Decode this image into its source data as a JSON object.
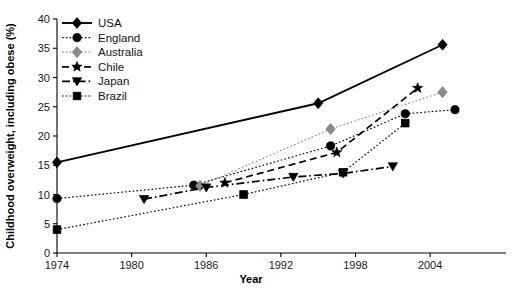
{
  "chart_data": {
    "type": "line",
    "title": "",
    "xlabel": "Year",
    "ylabel": "Childhood overweight, including obese (%)",
    "xlim": [
      1974,
      2006
    ],
    "ylim": [
      0,
      40
    ],
    "xticks": [
      1974,
      1980,
      1986,
      1992,
      1998,
      2004
    ],
    "yticks": [
      0,
      5,
      10,
      15,
      20,
      25,
      30,
      35,
      40
    ],
    "grid": false,
    "legend_position": "top-left",
    "series": [
      {
        "name": "USA",
        "color": "#000000",
        "marker": "diamond",
        "linestyle": "solid",
        "points": [
          {
            "x": 1974,
            "y": 15.5
          },
          {
            "x": 1995,
            "y": 25.6
          },
          {
            "x": 2005,
            "y": 35.6
          }
        ]
      },
      {
        "name": "England",
        "color": "#000000",
        "marker": "circle",
        "linestyle": "dotted",
        "points": [
          {
            "x": 1974,
            "y": 9.3
          },
          {
            "x": 1985,
            "y": 11.6
          },
          {
            "x": 1996,
            "y": 18.3
          },
          {
            "x": 2002,
            "y": 23.8
          },
          {
            "x": 2006,
            "y": 24.5
          }
        ]
      },
      {
        "name": "Australia",
        "color": "#8c8c8c",
        "marker": "diamond",
        "linestyle": "dotted",
        "points": [
          {
            "x": 1985.5,
            "y": 11.5
          },
          {
            "x": 1996,
            "y": 21.2
          },
          {
            "x": 2005,
            "y": 27.5
          }
        ]
      },
      {
        "name": "Chile",
        "color": "#000000",
        "marker": "star",
        "linestyle": "dashed",
        "points": [
          {
            "x": 1987.5,
            "y": 12.0
          },
          {
            "x": 1996.5,
            "y": 17.2
          },
          {
            "x": 2003,
            "y": 28.2
          }
        ]
      },
      {
        "name": "Japan",
        "color": "#000000",
        "marker": "triangle-down",
        "linestyle": "dash-dot",
        "points": [
          {
            "x": 1981,
            "y": 9.2
          },
          {
            "x": 1986,
            "y": 11.2
          },
          {
            "x": 1993,
            "y": 13.0
          },
          {
            "x": 1997,
            "y": 13.6
          },
          {
            "x": 2001,
            "y": 14.8
          }
        ]
      },
      {
        "name": "Brazil",
        "color": "#000000",
        "marker": "square",
        "linestyle": "dotted",
        "points": [
          {
            "x": 1974,
            "y": 4.0
          },
          {
            "x": 1989,
            "y": 10.0
          },
          {
            "x": 1997,
            "y": 13.8
          },
          {
            "x": 2002,
            "y": 22.2
          }
        ]
      }
    ]
  },
  "legend": {
    "items": [
      {
        "label": "USA"
      },
      {
        "label": "England"
      },
      {
        "label": "Australia"
      },
      {
        "label": "Chile"
      },
      {
        "label": "Japan"
      },
      {
        "label": "Brazil"
      }
    ]
  },
  "axes": {
    "x_title": "Year",
    "y_title": "Childhood overweight, including obese (%)",
    "x_tick_labels": [
      "1974",
      "1980",
      "1986",
      "1992",
      "1998",
      "2004"
    ],
    "y_tick_labels": [
      "0",
      "5",
      "10",
      "15",
      "20",
      "25",
      "30",
      "35",
      "40"
    ]
  },
  "colors": {
    "ink": "#000000",
    "gray_series": "#8c8c8c",
    "background": "#ffffff"
  }
}
